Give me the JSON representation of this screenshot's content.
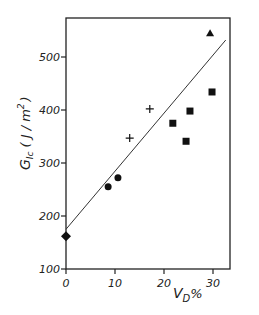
{
  "chart_data": {
    "type": "scatter",
    "title": "",
    "xlabel": "V_D%",
    "ylabel": "G_Ic (J/m²)",
    "xlim": [
      0,
      35
    ],
    "ylim": [
      100,
      570
    ],
    "x_ticks": [
      "0",
      "10",
      "20",
      "30"
    ],
    "y_ticks": [
      "100",
      "200",
      "300",
      "400",
      "500"
    ],
    "grid": false,
    "legend": null,
    "series": [
      {
        "name": "diamond",
        "marker": "diamond",
        "points": [
          {
            "x": 0,
            "y": 162
          }
        ]
      },
      {
        "name": "circle",
        "marker": "circle",
        "points": [
          {
            "x": 8.6,
            "y": 255
          },
          {
            "x": 10.6,
            "y": 272
          }
        ]
      },
      {
        "name": "cross",
        "marker": "plus",
        "points": [
          {
            "x": 13,
            "y": 347
          },
          {
            "x": 17.1,
            "y": 402
          }
        ]
      },
      {
        "name": "square",
        "marker": "square",
        "points": [
          {
            "x": 21.8,
            "y": 375
          },
          {
            "x": 24.5,
            "y": 341
          },
          {
            "x": 25.3,
            "y": 398
          },
          {
            "x": 29.8,
            "y": 434
          }
        ]
      },
      {
        "name": "triangle",
        "marker": "triangle",
        "points": [
          {
            "x": 29.4,
            "y": 545
          }
        ]
      }
    ],
    "fit_line": {
      "x": [
        0,
        32.6
      ],
      "y": [
        175,
        532
      ]
    }
  },
  "labels": {
    "ylabel_main": "G",
    "ylabel_sub": "Ic",
    "ylabel_unit": "( J / m",
    "ylabel_sup": "2",
    "ylabel_close": ")",
    "xlabel_main": "V",
    "xlabel_sub": "D",
    "xlabel_pct": "%"
  }
}
